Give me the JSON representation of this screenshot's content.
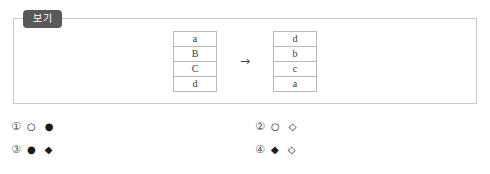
{
  "panel": {
    "tab_label": "보기"
  },
  "figure": {
    "arrow": "→",
    "source_table": {
      "name": "source-sequence",
      "cells": [
        "a",
        "B",
        "C",
        "d"
      ]
    },
    "target_table": {
      "name": "target-sequence",
      "cells": [
        "d",
        "b",
        "c",
        "a"
      ]
    }
  },
  "options": [
    {
      "number": "①",
      "glyphs": "○ ●"
    },
    {
      "number": "②",
      "glyphs": "○ ◇"
    },
    {
      "number": "③",
      "glyphs": "● ◆"
    },
    {
      "number": "④",
      "glyphs": "◆ ◇"
    }
  ],
  "colors": {
    "panel_border": "#c9c9c9",
    "tab_background": "#595959",
    "tab_text": "#ffffff",
    "cell_border": "#b9b9b9",
    "text": "#3a3a3a"
  }
}
